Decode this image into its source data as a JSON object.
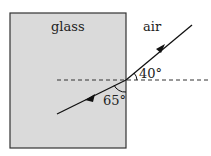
{
  "diagram": {
    "regions": [
      {
        "name": "glass",
        "label": "glass",
        "fill": "#d9d9d9"
      },
      {
        "name": "air",
        "label": "air",
        "fill": "#ffffff"
      }
    ],
    "angles": {
      "incident_to_surface": "40°",
      "refracted_to_surface": "65°"
    },
    "elements": {
      "normal_line": "dashed",
      "incident_ray_direction": "from upper right toward boundary",
      "refracted_ray_direction": "into glass toward lower left"
    }
  }
}
